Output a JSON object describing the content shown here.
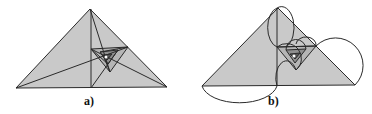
{
  "figures": [
    {
      "label": "a)",
      "description": "right isosceles triangle with inscribed spiral of nested triangles"
    },
    {
      "label": "b)",
      "description": "same triangle with semicircles drawn on spiral segments"
    }
  ],
  "colors": {
    "fill": "#c9c9c9",
    "fill_dark": "#8f8f8f",
    "stroke": "#2a2a2a"
  }
}
